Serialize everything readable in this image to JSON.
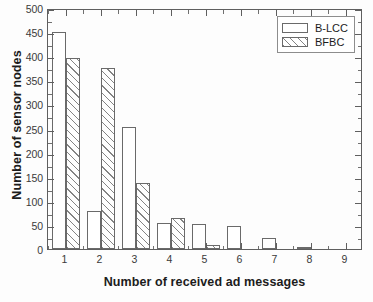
{
  "chart_data": {
    "type": "bar",
    "title": "",
    "xlabel": "Number of received ad messages",
    "ylabel": "Number of sensor nodes",
    "categories": [
      "1",
      "2",
      "3",
      "4",
      "5",
      "6",
      "7",
      "8",
      "9"
    ],
    "series": [
      {
        "name": "B-LCC",
        "style": "hollow",
        "values": [
          450,
          78,
          253,
          55,
          52,
          48,
          23,
          5,
          0
        ]
      },
      {
        "name": "BFBC",
        "style": "hatched",
        "values": [
          397,
          375,
          137,
          65,
          9,
          0,
          0,
          0,
          0
        ]
      }
    ],
    "xlim": [
      0.5,
      9.5
    ],
    "ylim": [
      0,
      500
    ],
    "ytick_step": 50,
    "yticks": [
      0,
      50,
      100,
      150,
      200,
      250,
      300,
      350,
      400,
      450,
      500
    ],
    "ytick_labels": [
      "0",
      "50",
      "100",
      "150",
      "200",
      "250",
      "300",
      "350",
      "400",
      "450",
      "500"
    ],
    "xticks": [
      1,
      2,
      3,
      4,
      5,
      6,
      7,
      8,
      9
    ],
    "xtick_labels": [
      "1",
      "2",
      "3",
      "4",
      "5",
      "6",
      "7",
      "8",
      "9"
    ],
    "grid": false,
    "legend_position": "top-right",
    "minor_ticks": true,
    "frame": "box"
  },
  "legend": {
    "entries": [
      {
        "label": "B-LCC"
      },
      {
        "label": "BFBC"
      }
    ]
  },
  "colors": {
    "axis": "#5f5f5f",
    "bar_edge": "#6a6a6a",
    "bar_fill": "#ffffff",
    "hatch": "#6e6e6e",
    "text": "#1c1c1c",
    "background": "#fdfdfd"
  }
}
